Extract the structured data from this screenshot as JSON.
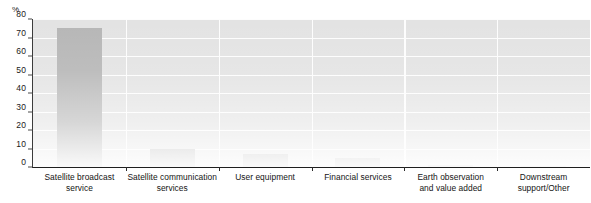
{
  "chart_data": {
    "type": "bar",
    "title": "",
    "xlabel": "",
    "ylabel": "%",
    "ylim": [
      0,
      80
    ],
    "yticks": [
      0,
      10,
      20,
      30,
      40,
      50,
      60,
      70,
      80
    ],
    "grid": true,
    "legend": false,
    "categories": [
      "Satellite broadcast service",
      "Satellite communication services",
      "User equipment",
      "Financial services",
      "Earth observation and value added",
      "Downstream support/Other"
    ],
    "category_lines": [
      [
        "Satellite broadcast",
        "service"
      ],
      [
        "Satellite communication",
        "services"
      ],
      [
        "User equipment"
      ],
      [
        "Financial services"
      ],
      [
        "Earth observation",
        "and value added"
      ],
      [
        "Downstream",
        "support/Other"
      ]
    ],
    "values": [
      75,
      10,
      7,
      5,
      1,
      0.5
    ],
    "bar_color": "#b6b6b6",
    "plot_background": "#e3e3e3",
    "gridline_color": "#fdfdfd",
    "axis_color": "#1f1f1f"
  },
  "axis": {
    "unit_label": "%",
    "tick_labels": [
      "80",
      "70",
      "60",
      "50",
      "40",
      "30",
      "20",
      "10",
      "0"
    ]
  }
}
